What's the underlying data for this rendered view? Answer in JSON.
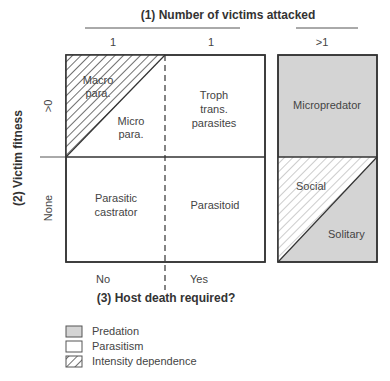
{
  "colors": {
    "predation": "#d4d4d4",
    "parasitism": "#ffffff",
    "stroke": "#333333",
    "hatch": "#333333",
    "hatch_light": "#aaaaaa"
  },
  "axes": {
    "top_title": "(1) Number of victims attacked",
    "top_ticks": [
      "1",
      "1",
      ">1"
    ],
    "left_title": "(2) Victim fitness",
    "left_ticks": [
      ">0",
      "None"
    ],
    "bottom_title": "(3) Host death required?",
    "bottom_ticks": [
      "No",
      "Yes"
    ]
  },
  "cells": {
    "macro": [
      "Macro",
      "para."
    ],
    "micro": [
      "Micro",
      "para."
    ],
    "troph": [
      "Troph",
      "trans.",
      "parasites"
    ],
    "castrator": [
      "Parasitic",
      "castrator"
    ],
    "parasitoid": "Parasitoid",
    "micropredator": "Micropredator",
    "social": "Social",
    "solitary": "Solitary"
  },
  "legend": [
    {
      "label": "Predation",
      "type": "predation"
    },
    {
      "label": "Parasitism",
      "type": "parasitism"
    },
    {
      "label": "Intensity dependence",
      "type": "hatch"
    }
  ]
}
